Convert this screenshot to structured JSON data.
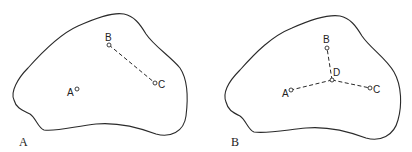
{
  "panels": [
    {
      "id": "A",
      "label": "A",
      "points": [
        {
          "name": "A",
          "label": "A"
        },
        {
          "name": "B",
          "label": "B"
        },
        {
          "name": "C",
          "label": "C"
        }
      ],
      "connections": [
        [
          "B",
          "C"
        ]
      ]
    },
    {
      "id": "B",
      "label": "B",
      "points": [
        {
          "name": "A",
          "label": "A"
        },
        {
          "name": "B",
          "label": "B"
        },
        {
          "name": "C",
          "label": "C"
        },
        {
          "name": "D",
          "label": "D"
        }
      ],
      "connections": [
        [
          "D",
          "B"
        ],
        [
          "D",
          "A"
        ],
        [
          "D",
          "C"
        ]
      ]
    }
  ]
}
